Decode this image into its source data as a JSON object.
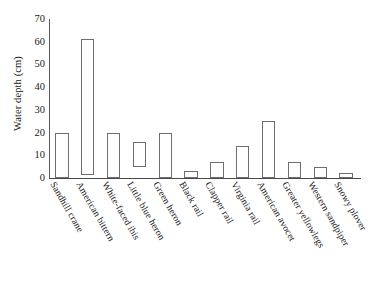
{
  "chart_data": {
    "type": "bar",
    "bar_style": "floating-range",
    "title": "",
    "subtitle": "",
    "xlabel": "",
    "ylabel": "Water depth (cm)",
    "ylim": [
      0,
      70
    ],
    "ytick_values": [
      0,
      10,
      20,
      30,
      40,
      50,
      60,
      70
    ],
    "ytick_labels": [
      "0",
      "10",
      "20",
      "30",
      "40",
      "50",
      "60",
      "70"
    ],
    "grid": false,
    "legend": null,
    "categories": [
      "Sandhill crane",
      "American bittern",
      "White-faced ibis",
      "Little blue heron",
      "Green heron",
      "Black rail",
      "Clapper rail",
      "Virginia rail",
      "American avocet",
      "Greater yellowlegs",
      "Western sandpiper",
      "Snowy plover"
    ],
    "series": [
      {
        "name": "Water depth range",
        "low": [
          0,
          1.5,
          0,
          5,
          0,
          0,
          0,
          0,
          0,
          0,
          0,
          0
        ],
        "high": [
          20,
          61,
          20,
          16,
          20,
          3,
          7,
          14,
          25,
          7,
          5,
          2
        ]
      }
    ],
    "values": [
      20,
      61,
      20,
      16,
      20,
      3,
      7,
      14,
      25,
      7,
      5,
      2
    ],
    "annotations": []
  }
}
